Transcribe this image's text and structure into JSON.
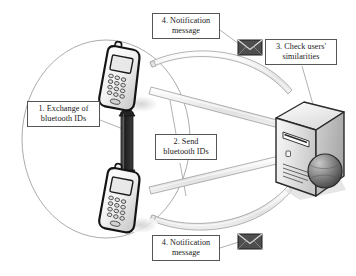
{
  "figure": {
    "type": "flow-diagram"
  },
  "callouts": {
    "exchange": {
      "line1": "1. Exchange of",
      "line2": "bluetooth IDs"
    },
    "send": {
      "line1": "2. Send",
      "line2": "bluetooth IDs"
    },
    "check": {
      "line1": "3. Check users'",
      "line2": "similarities"
    },
    "notification_top": {
      "line1": "4. Notification",
      "line2": "message"
    },
    "notification_bottom": {
      "line1": "4. Notification",
      "line2": "message"
    }
  },
  "icons": {
    "phone_top": "mobile-phone-icon",
    "phone_bottom": "mobile-phone-icon",
    "server": "server-tower-icon",
    "globe": "globe-icon",
    "envelope_top": "envelope-icon",
    "envelope_bottom": "envelope-icon",
    "range_circle": "bluetooth-range-circle",
    "exchange_arrow": "double-headed-arrow-icon"
  },
  "colors": {
    "outline": "#1a1a1a",
    "callout_border": "#555555",
    "pipe_fill": "#e9e9e9",
    "pipe_stroke": "#9a9a9a",
    "circle_stroke": "#9a9a9a",
    "leader_line": "#8a8a8a",
    "shadow": "#d9d9d9",
    "envelope_dark": "#4a4a4a",
    "server_light": "#f2f2f2",
    "server_mid": "#d4d4d4",
    "server_dark": "#b5b5b5",
    "background": "#ffffff"
  }
}
